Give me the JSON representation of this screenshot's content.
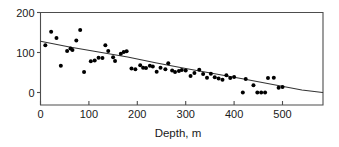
{
  "chart_data": {
    "type": "scatter",
    "title": "",
    "xlabel": "Depth, m",
    "ylabel": "",
    "xlim": [
      0,
      583
    ],
    "ylim": [
      -32,
      200
    ],
    "xticks": [
      0,
      100,
      200,
      300,
      400,
      500
    ],
    "xtick_labels": [
      "0",
      "100",
      "200",
      "300",
      "400",
      "500"
    ],
    "yticks": [
      0,
      100,
      200
    ],
    "ytick_labels": [
      "0",
      "100",
      "200"
    ],
    "grid": false,
    "legend": null,
    "marker": "filled-circle",
    "marker_color": "#000000",
    "series": [
      {
        "name": "observations",
        "points": [
          [
            10,
            118
          ],
          [
            22,
            152
          ],
          [
            33,
            136
          ],
          [
            42,
            67
          ],
          [
            55,
            104
          ],
          [
            62,
            110
          ],
          [
            66,
            106
          ],
          [
            74,
            130
          ],
          [
            82,
            156
          ],
          [
            90,
            51
          ],
          [
            104,
            78
          ],
          [
            112,
            80
          ],
          [
            120,
            87
          ],
          [
            128,
            86
          ],
          [
            134,
            118
          ],
          [
            140,
            104
          ],
          [
            150,
            88
          ],
          [
            154,
            79
          ],
          [
            166,
            97
          ],
          [
            172,
            101
          ],
          [
            178,
            103
          ],
          [
            188,
            60
          ],
          [
            196,
            58
          ],
          [
            206,
            68
          ],
          [
            212,
            62
          ],
          [
            218,
            61
          ],
          [
            226,
            67
          ],
          [
            232,
            65
          ],
          [
            240,
            52
          ],
          [
            248,
            62
          ],
          [
            258,
            58
          ],
          [
            264,
            73
          ],
          [
            272,
            55
          ],
          [
            278,
            51
          ],
          [
            286,
            54
          ],
          [
            292,
            56
          ],
          [
            300,
            55
          ],
          [
            310,
            41
          ],
          [
            318,
            49
          ],
          [
            328,
            57
          ],
          [
            336,
            46
          ],
          [
            344,
            37
          ],
          [
            352,
            47
          ],
          [
            360,
            38
          ],
          [
            368,
            35
          ],
          [
            376,
            32
          ],
          [
            384,
            43
          ],
          [
            392,
            36
          ],
          [
            400,
            39
          ],
          [
            418,
            0
          ],
          [
            424,
            34
          ],
          [
            440,
            18
          ],
          [
            448,
            0
          ],
          [
            456,
            0
          ],
          [
            464,
            0
          ],
          [
            470,
            36
          ],
          [
            482,
            37
          ],
          [
            492,
            12
          ],
          [
            500,
            14
          ]
        ]
      }
    ],
    "trend_line": {
      "name": "fitted-trend",
      "style": "solid",
      "color": "#333333",
      "points": [
        [
          0,
          128
        ],
        [
          60,
          114
        ],
        [
          120,
          101
        ],
        [
          180,
          89
        ],
        [
          240,
          74
        ],
        [
          300,
          60
        ],
        [
          360,
          47
        ],
        [
          420,
          34
        ],
        [
          480,
          20
        ],
        [
          540,
          6
        ],
        [
          583,
          0
        ]
      ]
    }
  }
}
